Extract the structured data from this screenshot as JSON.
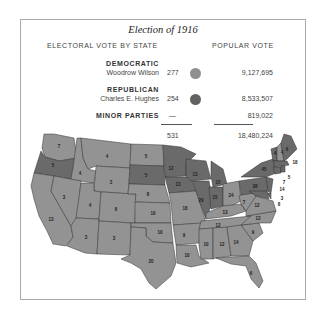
{
  "title": "Election of 1916",
  "headers": {
    "electoral": "ELECTORAL VOTE BY STATE",
    "popular": "POPULAR VOTE"
  },
  "rows": [
    {
      "party": "DEMOCRATIC",
      "candidate": "Woodrow Wilson",
      "electoral": "277",
      "popular": "9,127,695",
      "color": "#8a8a8a"
    },
    {
      "party": "REPUBLICAN",
      "candidate": "Charles E. Hughes",
      "electoral": "254",
      "popular": "8,533,507",
      "color": "#5f5f5f"
    },
    {
      "party": "MINOR PARTIES",
      "candidate": "",
      "electoral": "—",
      "popular": "819,022",
      "color": ""
    }
  ],
  "totals": {
    "electoral": "531",
    "popular": "18,480,224"
  },
  "colors": {
    "democratic": "#939393",
    "republican": "#6a6a6a",
    "border": "#333333"
  },
  "states": {
    "WA": "7",
    "OR": "5",
    "CA": "13",
    "ID": "4",
    "NV": "3",
    "MT": "4",
    "WY": "3",
    "UT": "4",
    "AZ": "3",
    "CO": "6",
    "NM": "3",
    "ND": "5",
    "SD": "5",
    "NE": "8",
    "KS": "10",
    "OK": "10",
    "TX": "20",
    "MN": "12",
    "IA": "13",
    "MO": "18",
    "AR": "9",
    "LA": "10",
    "WI": "13",
    "IL": "29",
    "MI": "15",
    "IN": "15",
    "OH": "24",
    "KY": "13",
    "TN": "12",
    "MS": "10",
    "AL": "12",
    "GA": "14",
    "FL": "6",
    "SC": "9",
    "NC": "12",
    "VA": "12",
    "WV": "8",
    "PA": "38",
    "NY": "45",
    "ME": "6",
    "NH": "4",
    "VT": "4",
    "MA": "18",
    "RI": "5",
    "CT": "7",
    "NJ": "14",
    "DE": "3",
    "MD": "8",
    "WV2": "7"
  }
}
